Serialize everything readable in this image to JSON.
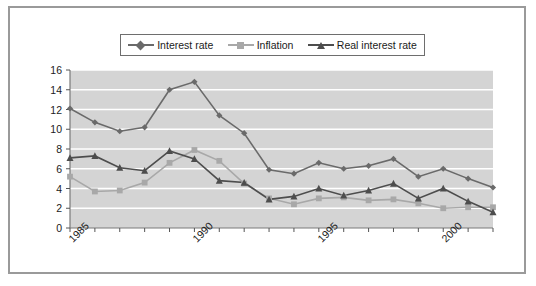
{
  "chart_data": {
    "type": "line",
    "title": "",
    "subtitle": "",
    "xlabel": "",
    "ylabel": "",
    "x": [
      1985,
      1986,
      1987,
      1988,
      1989,
      1990,
      1991,
      1992,
      1993,
      1994,
      1995,
      1996,
      1997,
      1998,
      1999,
      2000,
      2001,
      2002
    ],
    "xlim": [
      1985,
      2002
    ],
    "ylim": [
      0,
      16
    ],
    "yticks": [
      0,
      2,
      4,
      6,
      8,
      10,
      12,
      14,
      16
    ],
    "ytick_labels": [
      "0",
      "2",
      "4",
      "6",
      "8",
      "10",
      "12",
      "14",
      "16"
    ],
    "xtick_values": [
      1985,
      1990,
      1995,
      2000
    ],
    "xtick_labels": [
      "1985",
      "1990",
      "1995",
      "2000"
    ],
    "xtick_rotation": -45,
    "grid": "horizontal-white",
    "legend_position": "top-center",
    "plot_background": "#d4d4d4",
    "series": [
      {
        "name": "Interest rate",
        "marker": "diamond",
        "color": "#6a6a6a",
        "values": [
          12.1,
          10.7,
          9.8,
          10.2,
          14.0,
          14.8,
          11.4,
          9.6,
          5.9,
          5.5,
          6.6,
          6.0,
          6.3,
          7.0,
          5.2,
          6.0,
          5.0,
          4.1
        ]
      },
      {
        "name": "Inflation",
        "marker": "square",
        "color": "#a8a8a8",
        "values": [
          5.2,
          3.7,
          3.8,
          4.6,
          6.6,
          7.9,
          6.8,
          4.5,
          3.0,
          2.4,
          3.0,
          3.1,
          2.8,
          2.9,
          2.5,
          2.0,
          2.1,
          2.1
        ]
      },
      {
        "name": "Real interest rate",
        "marker": "triangle",
        "color": "#4d4d4d",
        "values": [
          7.1,
          7.3,
          6.1,
          5.8,
          7.8,
          7.0,
          4.8,
          4.6,
          2.9,
          3.2,
          4.0,
          3.3,
          3.8,
          4.5,
          3.0,
          4.0,
          2.7,
          1.6
        ]
      }
    ]
  },
  "legend": {
    "items": [
      {
        "label": "Interest rate"
      },
      {
        "label": "Inflation"
      },
      {
        "label": "Real interest rate"
      }
    ]
  }
}
